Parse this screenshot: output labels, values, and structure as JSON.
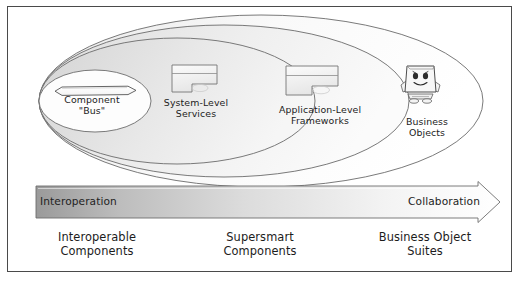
{
  "figure": {
    "background_color": "#ffffff",
    "frame_color": "#4a4a4a"
  },
  "ellipses": {
    "note": "Four nested ellipses sharing a common left edge, growing to the right",
    "fill_colors": [
      "#e2e2e2",
      "#e7e7e7",
      "#ededed",
      "#fbfbfb"
    ],
    "stroke_color": "#6b6b6b"
  },
  "nodes": [
    {
      "id": "component-bus",
      "label": "Component\n\"Bus\"",
      "icon": "component-bus-icon",
      "icon_shape": "elongated-hexagon",
      "ring": 1
    },
    {
      "id": "system-level-services",
      "label": "System-Level\nServices",
      "icon": "component-block-icon",
      "icon_shape": "notched-rectangle",
      "ring": 2
    },
    {
      "id": "application-level-frameworks",
      "label": "Application-Level\nFrameworks",
      "icon": "component-block-icon",
      "icon_shape": "notched-rectangle",
      "ring": 3
    },
    {
      "id": "business-objects",
      "label": "Business\nObjects",
      "icon": "smiling-box-character-icon",
      "icon_shape": "cartoon-box-figure",
      "ring": 4
    }
  ],
  "arrow_band": {
    "direction": "left-to-right",
    "left_label": "Interoperation",
    "right_label": "Collaboration",
    "gradient_start_color": "#9a9a9a",
    "gradient_end_color": "#ffffff",
    "stroke_color": "#6d6d6d"
  },
  "bottom_labels": [
    {
      "id": "interoperable-components",
      "label": "Interoperable\nComponents"
    },
    {
      "id": "supersmart-components",
      "label": "Supersmart\nComponents"
    },
    {
      "id": "business-object-suites",
      "label": "Business Object\nSuites"
    }
  ]
}
